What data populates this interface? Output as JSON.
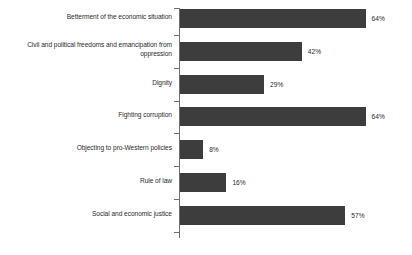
{
  "chart_data": {
    "type": "bar",
    "orientation": "horizontal",
    "title": "",
    "subtitle": "",
    "xlabel": "",
    "ylabel": "",
    "xlim": [
      0,
      80
    ],
    "grid": false,
    "legend": null,
    "value_suffix": "%",
    "categories": [
      "Betterment of the economic situation",
      "Civil and political freedoms and emancipation from oppression",
      "Dignity",
      "Fighting corruption",
      "Objecting to pro-Western policies",
      "Rule of law",
      "Social and economic justice"
    ],
    "values": [
      64,
      42,
      29,
      64,
      8,
      16,
      57
    ],
    "value_labels": [
      "64%",
      "42%",
      "29%",
      "64%",
      "8%",
      "16%",
      "57%"
    ],
    "bar_color": "#3d3d3d",
    "axis_color": "#6f6f6f",
    "label_color": "#2b2b2b",
    "background_color": "#ffffff"
  },
  "rows": [
    {
      "label": "Betterment of the economic situation",
      "label_line_1": "Betterment of the economic situation",
      "label_line_2": "",
      "value": 64,
      "value_label": "64%",
      "lines": 1
    },
    {
      "label": "Civil and political freedoms and emancipation from oppression",
      "label_line_1": "Civil and political freedoms and emancipation from",
      "label_line_2": "oppression",
      "value": 42,
      "value_label": "42%",
      "lines": 2
    },
    {
      "label": "Dignity",
      "label_line_1": "Dignity",
      "label_line_2": "",
      "value": 29,
      "value_label": "29%",
      "lines": 1
    },
    {
      "label": "Fighting corruption",
      "label_line_1": "Fighting corruption",
      "label_line_2": "",
      "value": 64,
      "value_label": "64%",
      "lines": 1
    },
    {
      "label": "Objecting to pro-Western policies",
      "label_line_1": "Objecting to pro-Western policies",
      "label_line_2": "",
      "value": 8,
      "value_label": "8%",
      "lines": 1
    },
    {
      "label": "Rule of law",
      "label_line_1": "Rule of law",
      "label_line_2": "",
      "value": 16,
      "value_label": "16%",
      "lines": 1
    },
    {
      "label": "Social and economic justice",
      "label_line_1": "Social and economic justice",
      "label_line_2": "",
      "value": 57,
      "value_label": "57%",
      "lines": 1
    }
  ],
  "source_note": ""
}
